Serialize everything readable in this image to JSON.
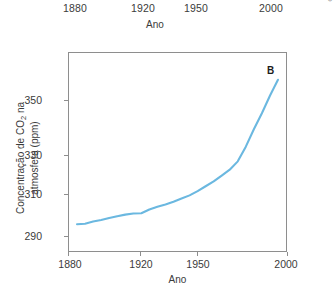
{
  "credit": "ADILSON SECCO",
  "top_axis": {
    "title": "Ano",
    "ticks": [
      {
        "label": "1880",
        "left": 63
      },
      {
        "label": "1920",
        "left": 131
      },
      {
        "label": "1950",
        "left": 184
      },
      {
        "label": "2000",
        "left": 259
      }
    ]
  },
  "panel": {
    "letter": "B"
  },
  "chart_data": {
    "type": "line",
    "title": "",
    "panel_label": "B",
    "xlabel": "Ano",
    "ylabel": "Concentração de CO2 na atmosfera (ppm)",
    "ylabel_line1": "Concentração de CO",
    "ylabel_sub": "2",
    "ylabel_line1_tail": " na",
    "ylabel_line2": "atmosfera (ppm)",
    "line_color": "#6bb8e0",
    "axis_color": "#8e8e8e",
    "grid": false,
    "legend": null,
    "xlim": [
      1875,
      2010
    ],
    "ylim": [
      283,
      357
    ],
    "xticks": [
      1880,
      1920,
      1950,
      2000
    ],
    "xtick_labels": [
      "1880",
      "1920",
      "1950",
      "2000"
    ],
    "yticks": [
      290,
      310,
      330,
      350
    ],
    "ytick_labels": [
      "290",
      "310",
      "330",
      "350"
    ],
    "series": [
      {
        "name": "Concentração de CO2 na atmosfera",
        "x": [
          1880,
          1885,
          1890,
          1895,
          1900,
          1905,
          1910,
          1915,
          1920,
          1925,
          1930,
          1935,
          1940,
          1945,
          1950,
          1955,
          1960,
          1965,
          1970,
          1975,
          1980,
          1985,
          1990,
          1995,
          2000,
          2005
        ],
        "y": [
          293.0,
          293.2,
          294.0,
          294.6,
          295.3,
          296.0,
          296.6,
          297.0,
          297.1,
          298.5,
          299.5,
          300.4,
          301.4,
          302.6,
          303.8,
          305.4,
          307.2,
          309.0,
          311.2,
          313.4,
          316.5,
          322.0,
          328.5,
          334.5,
          341.0,
          347.0
        ]
      }
    ],
    "annotations": [
      {
        "text": "B",
        "x": 1988,
        "y": 353
      }
    ]
  }
}
